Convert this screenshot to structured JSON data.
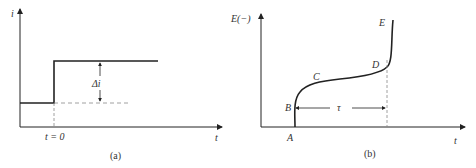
{
  "panels": {
    "a": {
      "caption": "(a)",
      "y_label": "i",
      "x_label": "t",
      "tick_label": "t = 0",
      "delta_label": "Δi"
    },
    "b": {
      "caption": "(b)",
      "y_label": "E(−)",
      "x_label": "t",
      "points": {
        "A": "A",
        "B": "B",
        "C": "C",
        "D": "D",
        "E": "E"
      },
      "interval_label": "τ"
    }
  },
  "colors": {
    "line": "#222222",
    "dash": "#888888",
    "text": "#333333"
  }
}
